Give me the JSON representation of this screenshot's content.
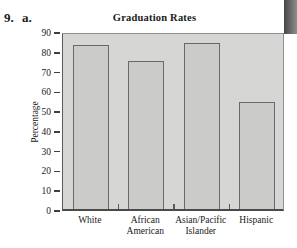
{
  "figure_label": "9. a.",
  "chart_data": {
    "type": "bar",
    "title": "Graduation Rates",
    "ylabel": "Percentage",
    "xlabel": "",
    "categories": [
      "White",
      "African American",
      "Asian/Pacific Islander",
      "Hispanic"
    ],
    "category_lines": [
      [
        "White"
      ],
      [
        "African",
        "American"
      ],
      [
        "Asian/Pacific",
        "Islander"
      ],
      [
        "Hispanic"
      ]
    ],
    "values": [
      83,
      75,
      84,
      54
    ],
    "ylim": [
      0,
      90
    ],
    "y_ticks": [
      0,
      10,
      20,
      30,
      40,
      50,
      60,
      70,
      80,
      90
    ],
    "grid": false,
    "legend": "none",
    "colors": {
      "plot_bg": "#d6d6d4",
      "bar_fill": "#cbcbc9",
      "bar_border": "#696969",
      "plot_border": "#909090",
      "axis": "#4a4a4a",
      "text": "#1a1a1a",
      "scan_artifact": "#474747"
    }
  }
}
